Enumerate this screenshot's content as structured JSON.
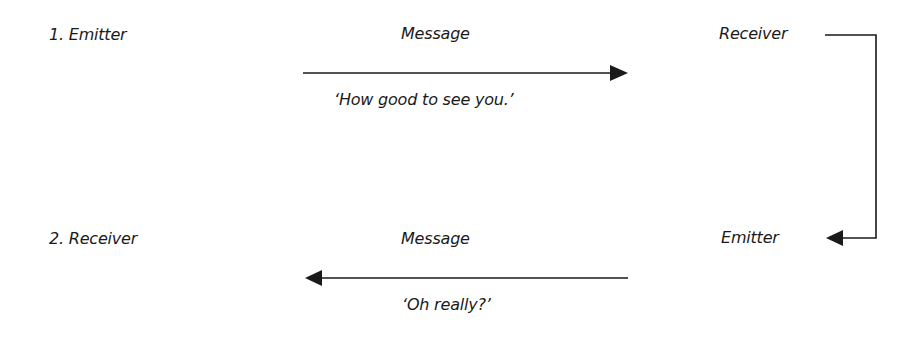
{
  "diagram": {
    "title": "",
    "exchange_1": {
      "emitter_label": "1. Emitter",
      "message_label": "Message",
      "receiver_label": "Receiver",
      "utterance": "‘How good to see you.’",
      "arrow_direction": "right"
    },
    "exchange_2": {
      "receiver_label": "2. Receiver",
      "message_label": "Message",
      "emitter_label": "Emitter",
      "utterance": "‘Oh really?’",
      "arrow_direction": "left"
    },
    "connector": {
      "description": "Elbow connector from top-right Receiver down to bottom-right Emitter",
      "arrow_direction": "left"
    },
    "colors": {
      "line": "#1a1a1a",
      "text": "#1a1a1a",
      "background": "#ffffff"
    }
  }
}
